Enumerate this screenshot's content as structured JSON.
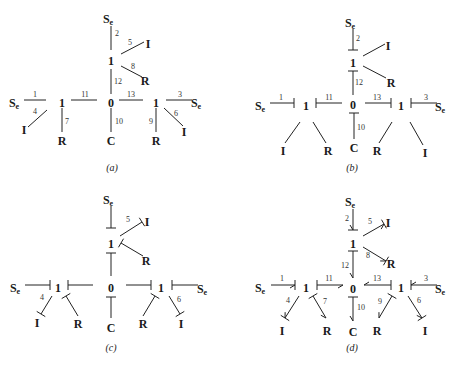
{
  "figure": {
    "panels": [
      {
        "id": "a",
        "caption": "(a)",
        "caption_pos": [
          112,
          171
        ],
        "nodes": [
          {
            "label": "S",
            "sub": "e",
            "x": 108,
            "y": 20
          },
          {
            "label": "1",
            "x": 111,
            "y": 62
          },
          {
            "label": "I",
            "x": 148,
            "y": 45
          },
          {
            "label": "R",
            "x": 145,
            "y": 82
          },
          {
            "label": "S",
            "sub": "e",
            "x": 14,
            "y": 104
          },
          {
            "label": "1",
            "x": 62,
            "y": 104
          },
          {
            "label": "0",
            "x": 111,
            "y": 104
          },
          {
            "label": "1",
            "x": 156,
            "y": 104
          },
          {
            "label": "S",
            "sub": "e",
            "x": 196,
            "y": 104
          },
          {
            "label": "I",
            "x": 24,
            "y": 131
          },
          {
            "label": "R",
            "x": 62,
            "y": 142
          },
          {
            "label": "C",
            "x": 111,
            "y": 142
          },
          {
            "label": "R",
            "x": 156,
            "y": 142
          },
          {
            "label": "I",
            "x": 184,
            "y": 133
          }
        ],
        "bonds": [
          {
            "n": "2",
            "x1": 111,
            "y1": 26,
            "x2": 111,
            "y2": 50,
            "nx": 117,
            "ny": 36
          },
          {
            "n": "5",
            "x1": 121,
            "y1": 54,
            "x2": 144,
            "y2": 42,
            "nx": 130,
            "ny": 45
          },
          {
            "n": "8",
            "x1": 121,
            "y1": 66,
            "x2": 142,
            "y2": 77,
            "nx": 133,
            "ny": 69
          },
          {
            "n": "12",
            "x1": 111,
            "y1": 69,
            "x2": 111,
            "y2": 94,
            "nx": 118,
            "ny": 84
          },
          {
            "n": "1",
            "x1": 24,
            "y1": 100,
            "x2": 46,
            "y2": 100,
            "nx": 35,
            "ny": 97
          },
          {
            "n": "4",
            "x1": 28,
            "y1": 127,
            "x2": 47,
            "y2": 110,
            "nx": 35,
            "ny": 114
          },
          {
            "n": "7",
            "x1": 62,
            "y1": 108,
            "x2": 62,
            "y2": 132,
            "nx": 67,
            "ny": 124
          },
          {
            "n": "11",
            "x1": 71,
            "y1": 100,
            "x2": 97,
            "y2": 100,
            "nx": 85,
            "ny": 97
          },
          {
            "n": "10",
            "x1": 111,
            "y1": 108,
            "x2": 111,
            "y2": 132,
            "nx": 119,
            "ny": 124
          },
          {
            "n": "13",
            "x1": 119,
            "y1": 100,
            "x2": 143,
            "y2": 100,
            "nx": 131,
            "ny": 97
          },
          {
            "n": "9",
            "x1": 156,
            "y1": 108,
            "x2": 156,
            "y2": 132,
            "nx": 151,
            "ny": 124
          },
          {
            "n": "3",
            "x1": 166,
            "y1": 100,
            "x2": 192,
            "y2": 100,
            "nx": 180,
            "ny": 97
          },
          {
            "n": "6",
            "x1": 164,
            "y1": 108,
            "x2": 183,
            "y2": 126,
            "nx": 176,
            "ny": 116
          }
        ]
      },
      {
        "id": "b",
        "caption": "(b)",
        "caption_pos": [
          352,
          171
        ],
        "nodes": [
          {
            "label": "S",
            "sub": "e",
            "x": 350,
            "y": 24
          },
          {
            "label": "1",
            "x": 353,
            "y": 64
          },
          {
            "label": "I",
            "x": 388,
            "y": 47
          },
          {
            "label": "R",
            "x": 391,
            "y": 84
          },
          {
            "label": "S",
            "sub": "e",
            "x": 260,
            "y": 107
          },
          {
            "label": "1",
            "x": 306,
            "y": 107
          },
          {
            "label": "0",
            "x": 353,
            "y": 106
          },
          {
            "label": "1",
            "x": 401,
            "y": 107
          },
          {
            "label": "S",
            "sub": "e",
            "x": 440,
            "y": 108
          },
          {
            "label": "I",
            "x": 283,
            "y": 152
          },
          {
            "label": "R",
            "x": 328,
            "y": 152
          },
          {
            "label": "C",
            "x": 354,
            "y": 149
          },
          {
            "label": "R",
            "x": 377,
            "y": 152
          },
          {
            "label": "I",
            "x": 425,
            "y": 154
          }
        ],
        "bonds": [
          {
            "n": "2",
            "x1": 353,
            "y1": 29,
            "x2": 353,
            "y2": 50,
            "nx": 358,
            "ny": 41,
            "stroke": "end"
          },
          {
            "n": "",
            "x1": 363,
            "y1": 56,
            "x2": 385,
            "y2": 44,
            "nx": 0,
            "ny": 0
          },
          {
            "n": "",
            "x1": 363,
            "y1": 66,
            "x2": 386,
            "y2": 78,
            "nx": 0,
            "ny": 0
          },
          {
            "n": "12",
            "x1": 353,
            "y1": 95,
            "x2": 353,
            "y2": 71,
            "nx": 359,
            "ny": 85,
            "stroke": "end"
          },
          {
            "n": "1",
            "x1": 270,
            "y1": 103,
            "x2": 294,
            "y2": 103,
            "nx": 281,
            "ny": 100,
            "stroke": "end"
          },
          {
            "n": "11",
            "x1": 342,
            "y1": 103,
            "x2": 316,
            "y2": 103,
            "nx": 329,
            "ny": 100,
            "stroke": "end"
          },
          {
            "n": "13",
            "x1": 365,
            "y1": 103,
            "x2": 391,
            "y2": 103,
            "nx": 377,
            "ny": 100,
            "stroke": "end"
          },
          {
            "n": "3",
            "x1": 437,
            "y1": 103,
            "x2": 411,
            "y2": 103,
            "nx": 426,
            "ny": 100,
            "stroke": "end"
          },
          {
            "n": "10",
            "x1": 354,
            "y1": 139,
            "x2": 354,
            "y2": 113,
            "nx": 361,
            "ny": 130,
            "stroke": "end"
          },
          {
            "n": "",
            "x1": 285,
            "y1": 143,
            "x2": 300,
            "y2": 122,
            "nx": 0,
            "ny": 0
          },
          {
            "n": "",
            "x1": 326,
            "y1": 143,
            "x2": 313,
            "y2": 122,
            "nx": 0,
            "ny": 0
          },
          {
            "n": "",
            "x1": 379,
            "y1": 143,
            "x2": 392,
            "y2": 122,
            "nx": 0,
            "ny": 0
          },
          {
            "n": "",
            "x1": 423,
            "y1": 145,
            "x2": 410,
            "y2": 122,
            "nx": 0,
            "ny": 0
          }
        ]
      },
      {
        "id": "c",
        "caption": "(c)",
        "caption_pos": [
          111,
          351
        ],
        "nodes": [
          {
            "label": "S",
            "sub": "e",
            "x": 108,
            "y": 201
          },
          {
            "label": "1",
            "x": 111,
            "y": 245
          },
          {
            "label": "I",
            "x": 147,
            "y": 223
          },
          {
            "label": "R",
            "x": 146,
            "y": 262
          },
          {
            "label": "S",
            "sub": "e",
            "x": 15,
            "y": 289
          },
          {
            "label": "1",
            "x": 58,
            "y": 289
          },
          {
            "label": "0",
            "x": 111,
            "y": 289
          },
          {
            "label": "1",
            "x": 161,
            "y": 289
          },
          {
            "label": "S",
            "sub": "e",
            "x": 202,
            "y": 290
          },
          {
            "label": "I",
            "x": 37,
            "y": 324
          },
          {
            "label": "R",
            "x": 78,
            "y": 325
          },
          {
            "label": "C",
            "x": 111,
            "y": 329
          },
          {
            "label": "R",
            "x": 143,
            "y": 325
          },
          {
            "label": "I",
            "x": 181,
            "y": 325
          }
        ],
        "bonds": [
          {
            "n": "",
            "x1": 111,
            "y1": 206,
            "x2": 111,
            "y2": 228,
            "nx": 0,
            "ny": 0,
            "stroke": "end"
          },
          {
            "n": "5",
            "x1": 120,
            "y1": 236,
            "x2": 142,
            "y2": 222,
            "nx": 128,
            "ny": 222,
            "stroke": "end"
          },
          {
            "n": "",
            "x1": 143,
            "y1": 256,
            "x2": 121,
            "y2": 243,
            "nx": 0,
            "ny": 0,
            "stroke": "end"
          },
          {
            "n": "",
            "x1": 111,
            "y1": 276,
            "x2": 111,
            "y2": 253,
            "nx": 0,
            "ny": 0,
            "stroke": "end"
          },
          {
            "n": "",
            "x1": 25,
            "y1": 285,
            "x2": 50,
            "y2": 285,
            "nx": 0,
            "ny": 0,
            "stroke": "end"
          },
          {
            "n": "",
            "x1": 93,
            "y1": 285,
            "x2": 68,
            "y2": 285,
            "nx": 0,
            "ny": 0,
            "stroke": "end"
          },
          {
            "n": "",
            "x1": 126,
            "y1": 285,
            "x2": 151,
            "y2": 285,
            "nx": 0,
            "ny": 0,
            "stroke": "end"
          },
          {
            "n": "",
            "x1": 198,
            "y1": 285,
            "x2": 172,
            "y2": 285,
            "nx": 0,
            "ny": 0,
            "stroke": "end"
          },
          {
            "n": "4",
            "x1": 52,
            "y1": 296,
            "x2": 41,
            "y2": 314,
            "nx": 42,
            "ny": 300,
            "stroke": "end"
          },
          {
            "n": "",
            "x1": 78,
            "y1": 316,
            "x2": 66,
            "y2": 296,
            "nx": 0,
            "ny": 0,
            "stroke": "end"
          },
          {
            "n": "",
            "x1": 111,
            "y1": 318,
            "x2": 111,
            "y2": 297,
            "nx": 0,
            "ny": 0,
            "stroke": "end"
          },
          {
            "n": "",
            "x1": 143,
            "y1": 316,
            "x2": 155,
            "y2": 296,
            "nx": 0,
            "ny": 0,
            "stroke": "end"
          },
          {
            "n": "6",
            "x1": 169,
            "y1": 296,
            "x2": 180,
            "y2": 314,
            "nx": 179,
            "ny": 302,
            "stroke": "end"
          }
        ]
      },
      {
        "id": "d",
        "caption": "(d)",
        "caption_pos": [
          352,
          351
        ],
        "nodes": [
          {
            "label": "S",
            "sub": "e",
            "x": 350,
            "y": 203
          },
          {
            "label": "1",
            "x": 353,
            "y": 245
          },
          {
            "label": "I",
            "x": 388,
            "y": 224
          },
          {
            "label": "R",
            "x": 391,
            "y": 265
          },
          {
            "label": "S",
            "sub": "e",
            "x": 260,
            "y": 289
          },
          {
            "label": "1",
            "x": 306,
            "y": 289
          },
          {
            "label": "0",
            "x": 353,
            "y": 290
          },
          {
            "label": "1",
            "x": 401,
            "y": 289
          },
          {
            "label": "S",
            "sub": "e",
            "x": 440,
            "y": 290
          },
          {
            "label": "I",
            "x": 282,
            "y": 332
          },
          {
            "label": "R",
            "x": 327,
            "y": 332
          },
          {
            "label": "C",
            "x": 353,
            "y": 333
          },
          {
            "label": "R",
            "x": 377,
            "y": 332
          },
          {
            "label": "I",
            "x": 425,
            "y": 332
          }
        ],
        "bonds": [
          {
            "n": "2",
            "x1": 353,
            "y1": 209,
            "x2": 353,
            "y2": 230,
            "nx": 347,
            "ny": 221,
            "stroke": "end",
            "arrow": "end"
          },
          {
            "n": "5",
            "x1": 363,
            "y1": 236,
            "x2": 384,
            "y2": 224,
            "nx": 370,
            "ny": 224,
            "stroke": "end",
            "arrow": "end"
          },
          {
            "n": "8",
            "x1": 363,
            "y1": 247,
            "x2": 386,
            "y2": 261,
            "nx": 368,
            "ny": 258,
            "stroke": "end",
            "arrow": "end"
          },
          {
            "n": "12",
            "x1": 353,
            "y1": 251,
            "x2": 353,
            "y2": 278,
            "nx": 345,
            "ny": 268,
            "stroke": "start",
            "arrow": "end"
          },
          {
            "n": "1",
            "x1": 271,
            "y1": 285,
            "x2": 295,
            "y2": 285,
            "nx": 282,
            "ny": 281,
            "stroke": "end",
            "arrow": "end"
          },
          {
            "n": "11",
            "x1": 317,
            "y1": 285,
            "x2": 343,
            "y2": 285,
            "nx": 329,
            "ny": 281,
            "stroke": "start",
            "arrow": "end"
          },
          {
            "n": "13",
            "x1": 391,
            "y1": 285,
            "x2": 364,
            "y2": 285,
            "nx": 377,
            "ny": 281,
            "stroke": "start",
            "arrow": "end"
          },
          {
            "n": "3",
            "x1": 437,
            "y1": 285,
            "x2": 411,
            "y2": 285,
            "nx": 426,
            "ny": 281,
            "stroke": "end",
            "arrow": "end"
          },
          {
            "n": "4",
            "x1": 299,
            "y1": 296,
            "x2": 285,
            "y2": 318,
            "nx": 288,
            "ny": 303,
            "stroke": "end",
            "arrow": "end"
          },
          {
            "n": "7",
            "x1": 313,
            "y1": 296,
            "x2": 326,
            "y2": 318,
            "nx": 325,
            "ny": 304,
            "stroke": "start",
            "arrow": "end"
          },
          {
            "n": "10",
            "x1": 353,
            "y1": 297,
            "x2": 353,
            "y2": 321,
            "nx": 361,
            "ny": 310,
            "stroke": "start",
            "arrow": "end"
          },
          {
            "n": "9",
            "x1": 392,
            "y1": 296,
            "x2": 379,
            "y2": 318,
            "nx": 380,
            "ny": 304,
            "stroke": "start",
            "arrow": "end"
          },
          {
            "n": "6",
            "x1": 408,
            "y1": 296,
            "x2": 422,
            "y2": 318,
            "nx": 419,
            "ny": 303,
            "stroke": "end",
            "arrow": "end"
          }
        ]
      }
    ]
  }
}
